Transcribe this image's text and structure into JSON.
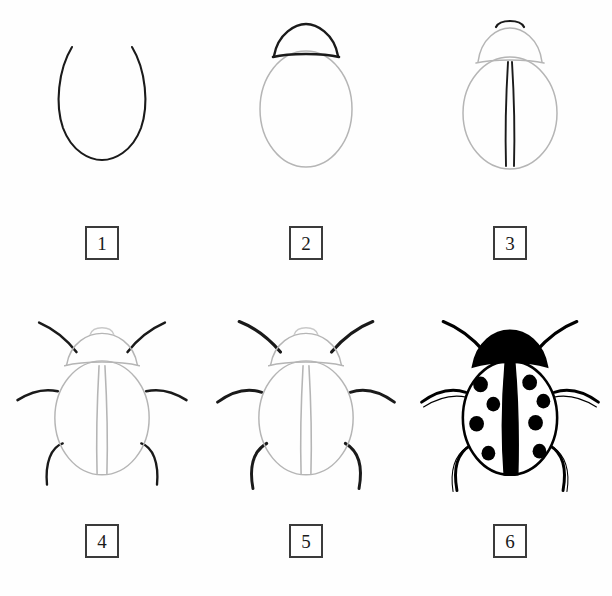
{
  "sheet": {
    "title": "How to Draw a Ladybug - 6 Step Tutorial",
    "background_color": "#fefefe",
    "width": 612,
    "height": 596,
    "columns": 3,
    "rows": 2
  },
  "colors": {
    "ink_dark": "#1a1a1a",
    "ink_black": "#000000",
    "guide_gray": "#b5b5b5",
    "guide_gray_light": "#c9c9c9",
    "box_border": "#3b3b3b",
    "paper": "#ffffff"
  },
  "steps": [
    {
      "number": "1",
      "label": "Step 1",
      "description": "Draw an open U-shaped curve forming the lower body outline",
      "new_elements": [
        "body-u-curve"
      ],
      "stroke_color": "#1a1a1a"
    },
    {
      "number": "2",
      "label": "Step 2",
      "description": "Close the oval body and add the dark head dome arc on top",
      "new_elements": [
        "head-dome",
        "head-baseline"
      ],
      "stroke_color": "#1a1a1a"
    },
    {
      "number": "3",
      "label": "Step 3",
      "description": "Draw the dark center wing split line and a small arc above the head",
      "new_elements": [
        "wing-split-line",
        "head-crown-arc"
      ],
      "stroke_color": "#1a1a1a"
    },
    {
      "number": "4",
      "label": "Step 4",
      "description": "Add six legs: two antennae-like front legs, two middle legs, two rear legs",
      "new_elements": [
        "front-legs",
        "middle-legs",
        "rear-legs"
      ],
      "stroke_color": "#1a1a1a"
    },
    {
      "number": "5",
      "label": "Step 5",
      "description": "Thicken and refine the legs with tapered curved strokes",
      "new_elements": [
        "refined-legs"
      ],
      "stroke_color": "#1a1a1a"
    },
    {
      "number": "6",
      "label": "Step 6",
      "description": "Fill the head solid black, thicken the center stripe, and add eight black spots",
      "new_elements": [
        "black-head",
        "black-center-stripe",
        "spots"
      ],
      "stroke_color": "#000000",
      "spot_count": 8,
      "spots_per_wing": 4
    }
  ]
}
